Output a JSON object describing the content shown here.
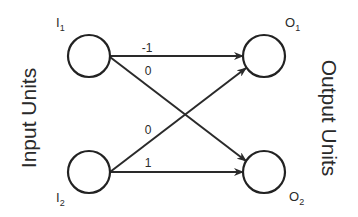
{
  "diagram": {
    "type": "neural-network",
    "left_title": "Input Units",
    "right_title": "Output Units",
    "nodes": [
      {
        "id": "I1",
        "letter": "I",
        "sub": "1",
        "layer": "input"
      },
      {
        "id": "I2",
        "letter": "I",
        "sub": "2",
        "layer": "input"
      },
      {
        "id": "O1",
        "letter": "O",
        "sub": "1",
        "layer": "output"
      },
      {
        "id": "O2",
        "letter": "O",
        "sub": "2",
        "layer": "output"
      }
    ],
    "edges": [
      {
        "from": "I1",
        "to": "O1",
        "weight": "-1"
      },
      {
        "from": "I1",
        "to": "O2",
        "weight": "0"
      },
      {
        "from": "I2",
        "to": "O1",
        "weight": "0"
      },
      {
        "from": "I2",
        "to": "O2",
        "weight": "1"
      }
    ],
    "colors": {
      "stroke": "#222222",
      "background": "#ffffff"
    }
  }
}
